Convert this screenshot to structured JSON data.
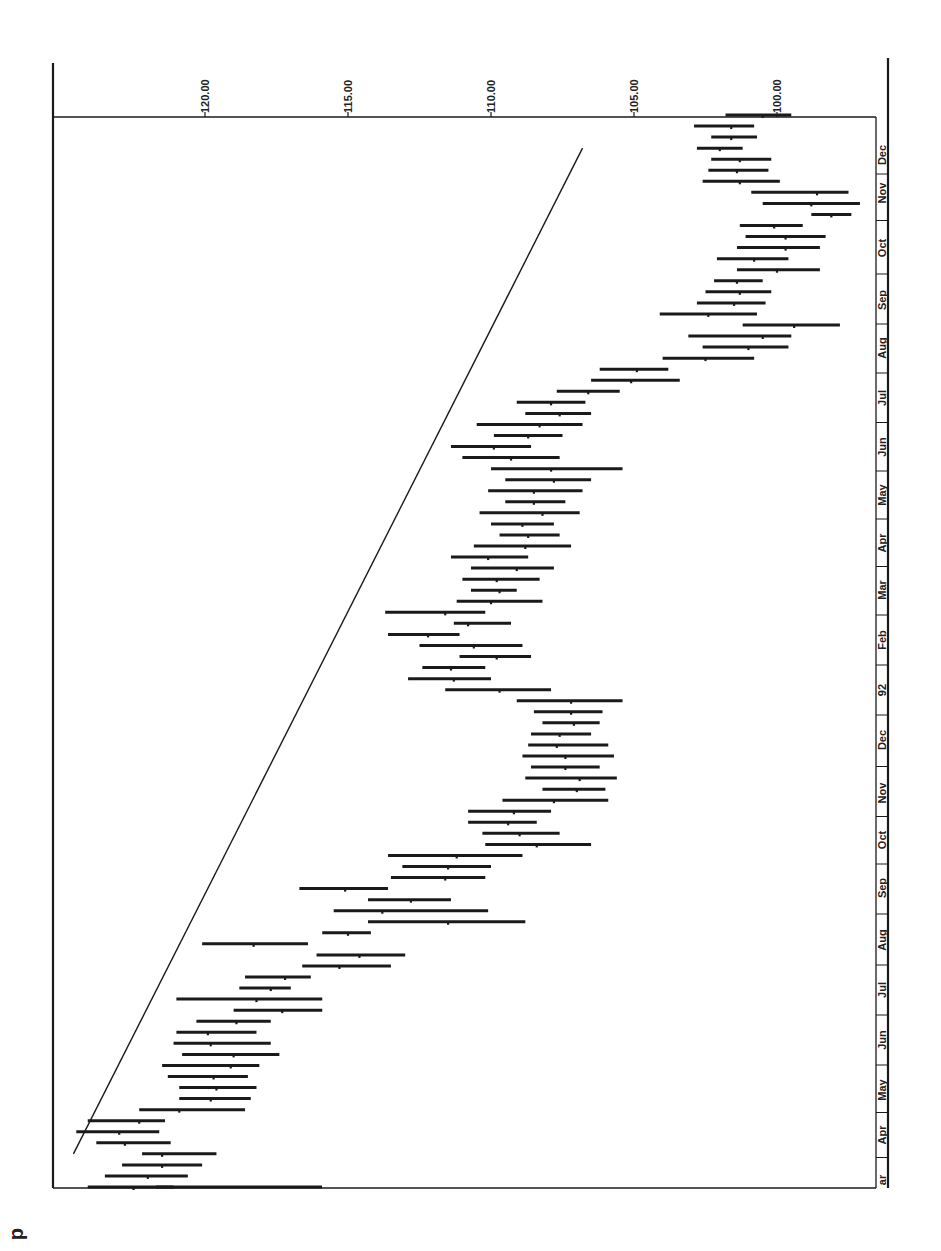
{
  "chart_data": {
    "type": "bar",
    "subtype": "high-low-close",
    "orientation": "rotated-90-clockwise",
    "title": "",
    "xlabel": "",
    "ylabel": "",
    "ylim": [
      96.6,
      125.3
    ],
    "y_ticks": [
      "120.00",
      "115.00",
      "110.00",
      "105.00",
      "100.00"
    ],
    "y_tick_values": [
      120,
      115,
      110,
      105,
      100
    ],
    "x_tick_labels_top_to_bottom": [
      "Dec",
      "Nov",
      "Oct",
      "Sep",
      "Aug",
      "Jul",
      "Jun",
      "May",
      "Apr",
      "Mar",
      "Feb",
      "92",
      "Dec",
      "Nov",
      "Oct",
      "Sep",
      "Aug",
      "Jul",
      "Jun",
      "May",
      "Apr",
      "ar"
    ],
    "grid": false,
    "legend": null,
    "trendline": {
      "start": {
        "period_index": 3,
        "value": 124.6
      },
      "end": {
        "period_index": 94,
        "value": 106.8
      }
    },
    "bars_note": "weekly bars listed oldest (bottom, Mar '91) to newest (top, Dec '92); values high/low/close",
    "bars": [
      {
        "high": 124.1,
        "low": 121.1,
        "close": 122.5
      },
      {
        "high": 123.5,
        "low": 120.6,
        "close": 122.0
      },
      {
        "high": 122.9,
        "low": 120.1,
        "close": 121.5
      },
      {
        "high": 122.2,
        "low": 119.6,
        "close": 121.5
      },
      {
        "high": 123.8,
        "low": 121.2,
        "close": 122.8
      },
      {
        "high": 124.5,
        "low": 121.6,
        "close": 123.0
      },
      {
        "high": 124.1,
        "low": 121.4,
        "close": 122.3
      },
      {
        "high": 122.3,
        "low": 118.6,
        "close": 120.9
      },
      {
        "high": 120.9,
        "low": 118.4,
        "close": 119.8
      },
      {
        "high": 120.9,
        "low": 118.2,
        "close": 119.6
      },
      {
        "high": 121.3,
        "low": 118.5,
        "close": 119.7
      },
      {
        "high": 121.5,
        "low": 118.1,
        "close": 119.1
      },
      {
        "high": 120.8,
        "low": 117.4,
        "close": 119.0
      },
      {
        "high": 121.1,
        "low": 117.7,
        "close": 119.8
      },
      {
        "high": 121.0,
        "low": 118.2,
        "close": 119.9
      },
      {
        "high": 120.3,
        "low": 117.7,
        "close": 118.9
      },
      {
        "high": 119.0,
        "low": 115.9,
        "close": 117.3
      },
      {
        "high": 121.0,
        "low": 115.9,
        "close": 118.2
      },
      {
        "high": 118.8,
        "low": 117.0,
        "close": 117.7
      },
      {
        "high": 118.6,
        "low": 116.3,
        "close": 117.2
      },
      {
        "high": 116.6,
        "low": 113.5,
        "close": 115.3
      },
      {
        "high": 116.1,
        "low": 113.0,
        "close": 114.6
      },
      {
        "high": 120.1,
        "low": 116.4,
        "close": 118.3
      },
      {
        "high": 115.9,
        "low": 114.2,
        "close": 115.0
      },
      {
        "high": 114.3,
        "low": 108.8,
        "close": 111.5
      },
      {
        "high": 115.5,
        "low": 110.1,
        "close": 113.8
      },
      {
        "high": 114.3,
        "low": 111.4,
        "close": 112.8
      },
      {
        "high": 116.7,
        "low": 113.6,
        "close": 115.1
      },
      {
        "high": 113.5,
        "low": 110.2,
        "close": 111.6
      },
      {
        "high": 113.1,
        "low": 110.0,
        "close": 111.5
      },
      {
        "high": 113.6,
        "low": 108.9,
        "close": 111.2
      },
      {
        "high": 110.2,
        "low": 106.5,
        "close": 108.4
      },
      {
        "high": 110.3,
        "low": 107.6,
        "close": 109.0
      },
      {
        "high": 110.8,
        "low": 108.4,
        "close": 109.4
      },
      {
        "high": 110.8,
        "low": 107.9,
        "close": 109.2
      },
      {
        "high": 109.6,
        "low": 105.9,
        "close": 107.8
      },
      {
        "high": 108.2,
        "low": 106.0,
        "close": 107.0
      },
      {
        "high": 108.8,
        "low": 105.6,
        "close": 106.9
      },
      {
        "high": 108.6,
        "low": 106.2,
        "close": 107.4
      },
      {
        "high": 108.9,
        "low": 105.7,
        "close": 107.4
      },
      {
        "high": 108.7,
        "low": 105.9,
        "close": 107.7
      },
      {
        "high": 108.6,
        "low": 106.5,
        "close": 107.6
      },
      {
        "high": 108.2,
        "low": 106.2,
        "close": 107.1
      },
      {
        "high": 108.5,
        "low": 106.1,
        "close": 107.2
      },
      {
        "high": 109.1,
        "low": 105.4,
        "close": 107.2
      },
      {
        "high": 111.6,
        "low": 107.9,
        "close": 109.7
      },
      {
        "high": 112.9,
        "low": 110.0,
        "close": 111.3
      },
      {
        "high": 112.4,
        "low": 110.2,
        "close": 111.4
      },
      {
        "high": 111.1,
        "low": 108.6,
        "close": 109.8
      },
      {
        "high": 112.5,
        "low": 108.9,
        "close": 110.6
      },
      {
        "high": 113.6,
        "low": 111.1,
        "close": 112.2
      },
      {
        "high": 111.3,
        "low": 109.3,
        "close": 110.8
      },
      {
        "high": 113.7,
        "low": 110.2,
        "close": 111.6
      },
      {
        "high": 111.2,
        "low": 108.2,
        "close": 110.0
      },
      {
        "high": 110.7,
        "low": 109.1,
        "close": 109.7
      },
      {
        "high": 111.0,
        "low": 108.3,
        "close": 109.8
      },
      {
        "high": 110.7,
        "low": 107.8,
        "close": 109.1
      },
      {
        "high": 111.4,
        "low": 108.7,
        "close": 110.1
      },
      {
        "high": 110.6,
        "low": 107.2,
        "close": 108.8
      },
      {
        "high": 109.7,
        "low": 107.6,
        "close": 108.7
      },
      {
        "high": 110.0,
        "low": 107.8,
        "close": 108.9
      },
      {
        "high": 110.4,
        "low": 106.9,
        "close": 108.2
      },
      {
        "high": 109.5,
        "low": 107.4,
        "close": 108.5
      },
      {
        "high": 110.1,
        "low": 106.8,
        "close": 108.5
      },
      {
        "high": 109.5,
        "low": 106.5,
        "close": 107.8
      },
      {
        "high": 110.0,
        "low": 105.4,
        "close": 107.9
      },
      {
        "high": 111.0,
        "low": 107.6,
        "close": 109.3
      },
      {
        "high": 111.4,
        "low": 108.6,
        "close": 109.9
      },
      {
        "high": 109.9,
        "low": 107.5,
        "close": 108.7
      },
      {
        "high": 110.5,
        "low": 106.8,
        "close": 108.3
      },
      {
        "high": 108.8,
        "low": 106.5,
        "close": 107.6
      },
      {
        "high": 109.1,
        "low": 106.7,
        "close": 107.9
      },
      {
        "high": 107.7,
        "low": 105.5,
        "close": 106.6
      },
      {
        "high": 106.5,
        "low": 103.4,
        "close": 105.1
      },
      {
        "high": 106.2,
        "low": 103.8,
        "close": 104.9
      },
      {
        "high": 104.0,
        "low": 100.8,
        "close": 102.5
      },
      {
        "high": 102.6,
        "low": 99.6,
        "close": 101.0
      },
      {
        "high": 103.1,
        "low": 99.5,
        "close": 100.5
      },
      {
        "high": 101.2,
        "low": 97.8,
        "close": 99.4
      },
      {
        "high": 104.1,
        "low": 100.7,
        "close": 102.4
      },
      {
        "high": 102.8,
        "low": 100.4,
        "close": 101.5
      },
      {
        "high": 102.5,
        "low": 100.2,
        "close": 101.3
      },
      {
        "high": 102.2,
        "low": 100.5,
        "close": 101.4
      },
      {
        "high": 101.4,
        "low": 98.5,
        "close": 100.0
      },
      {
        "high": 102.1,
        "low": 99.6,
        "close": 100.8
      },
      {
        "high": 101.4,
        "low": 98.5,
        "close": 99.7
      },
      {
        "high": 101.1,
        "low": 98.3,
        "close": 99.7
      },
      {
        "high": 101.3,
        "low": 99.1,
        "close": 100.1
      },
      {
        "high": 98.8,
        "low": 97.4,
        "close": 98.1
      },
      {
        "high": 100.5,
        "low": 97.1,
        "close": 98.8
      },
      {
        "high": 100.9,
        "low": 97.5,
        "close": 98.6
      },
      {
        "high": 102.6,
        "low": 99.9,
        "close": 101.3
      },
      {
        "high": 102.4,
        "low": 100.3,
        "close": 101.4
      },
      {
        "high": 102.3,
        "low": 100.2,
        "close": 101.3
      },
      {
        "high": 102.8,
        "low": 101.2,
        "close": 102.0
      },
      {
        "high": 102.3,
        "low": 100.7,
        "close": 101.6
      },
      {
        "high": 102.9,
        "low": 100.8,
        "close": 101.6
      },
      {
        "high": 101.8,
        "low": 99.5,
        "close": 100.5
      }
    ]
  },
  "page": {
    "corner_glyph": "d"
  }
}
